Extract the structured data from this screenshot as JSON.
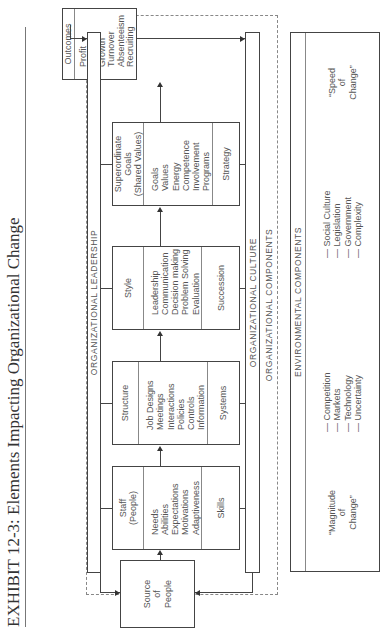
{
  "title": "EXHIBIT 12-3: Elements Impacting Organizational Change",
  "source": {
    "lines": [
      "Source",
      "of",
      "People"
    ]
  },
  "outcomes": {
    "label": "Outcomes",
    "items": [
      "Profit",
      "ROI",
      "Growth",
      "Turnover",
      "Absenteeism",
      "Recruiting"
    ]
  },
  "leadership_bar": {
    "label": "ORGANIZATIONAL LEADERSHIP"
  },
  "culture_bar": {
    "label": "ORGANIZATIONAL CULTURE"
  },
  "org_components_label": "ORGANIZATIONAL COMPONENTS",
  "components": [
    {
      "head": [
        "Staff",
        "(People)"
      ],
      "items": [
        "Needs",
        "Abilities",
        "Expectations",
        "Motivations",
        "Adaptiveness"
      ],
      "foot": "Skills"
    },
    {
      "head": [
        "Structure"
      ],
      "items": [
        "Job Designs",
        "Meetings",
        "Interactions",
        "Policies",
        "Controls",
        "Information"
      ],
      "foot": "Systems"
    },
    {
      "head": [
        "Style"
      ],
      "items": [
        "Leadership",
        "Communication",
        "Decision making",
        "Problem Solving",
        "Evaluation"
      ],
      "foot": "Succession"
    },
    {
      "head": [
        "Superordinate",
        "Goals",
        "(Shared Values)"
      ],
      "items": [
        "Goals",
        "Values",
        "Energy",
        "Competence",
        "Involvement",
        "Programs"
      ],
      "foot": "Strategy"
    }
  ],
  "environment": {
    "label": "ENVIRONMENTAL COMPONENTS",
    "left_note": [
      "“Magnitude",
      "of",
      "Change”"
    ],
    "col1": [
      "— Competition",
      "— Markets",
      "— Technology",
      "— Uncertainty"
    ],
    "col2": [
      "— Social Culture",
      "— Legislation",
      "— Government",
      "— Complexity"
    ],
    "right_note": [
      "“Speed",
      "of",
      "Change”"
    ]
  }
}
